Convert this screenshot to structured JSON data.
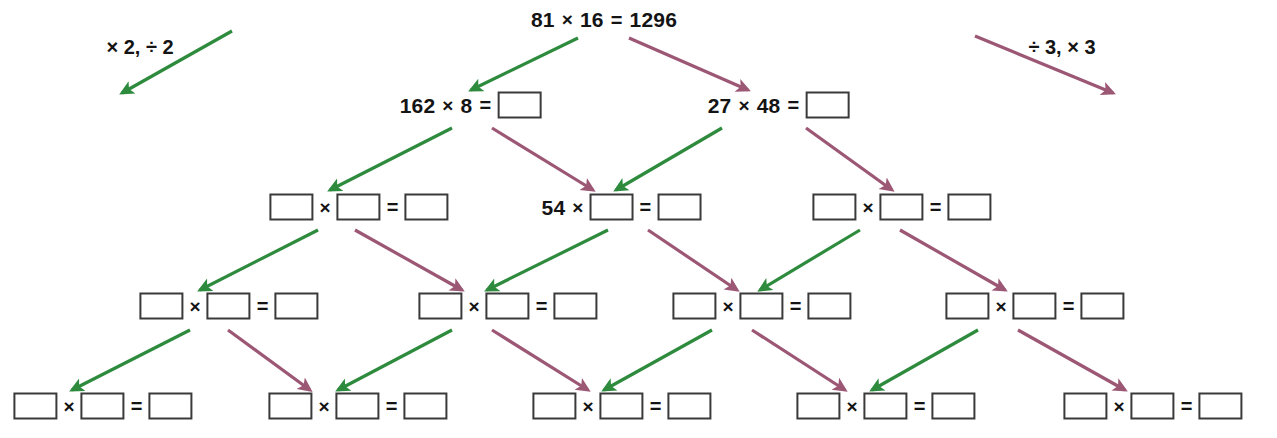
{
  "page": {
    "background": "#ffffff",
    "width": 1277,
    "height": 438
  },
  "colors": {
    "green_arrow": "#2e8b3d",
    "purple_arrow": "#9c5775",
    "text": "#141414",
    "box_border": "#3a3a3a"
  },
  "legend": {
    "left": {
      "label": "× 2, ÷ 2",
      "x": 140,
      "y": 47,
      "arrow_color": "green_arrow",
      "arrow": {
        "x1": 232,
        "y1": 31,
        "x2": 122,
        "y2": 93
      }
    },
    "right": {
      "label": "÷ 3, × 3",
      "x": 1062,
      "y": 47,
      "arrow_color": "purple_arrow",
      "arrow": {
        "x1": 975,
        "y1": 36,
        "x2": 1113,
        "y2": 93
      }
    }
  },
  "symbols": {
    "times": "×",
    "equals": "=",
    "divide": "÷"
  },
  "rows": [
    {
      "index": 0,
      "y": 20,
      "nodes": [
        {
          "id": "n0-0",
          "x": 604,
          "a": {
            "type": "text",
            "value": "81"
          },
          "b": {
            "type": "text",
            "value": "16"
          },
          "c": {
            "type": "text",
            "value": "1296"
          }
        }
      ]
    },
    {
      "index": 1,
      "y": 105,
      "nodes": [
        {
          "id": "n1-0",
          "x": 470,
          "a": {
            "type": "text",
            "value": "162"
          },
          "b": {
            "type": "text",
            "value": "8"
          },
          "c": {
            "type": "blank",
            "value": ""
          }
        },
        {
          "id": "n1-1",
          "x": 778,
          "a": {
            "type": "text",
            "value": "27"
          },
          "b": {
            "type": "text",
            "value": "48"
          },
          "c": {
            "type": "blank",
            "value": ""
          }
        }
      ]
    },
    {
      "index": 2,
      "y": 207,
      "nodes": [
        {
          "id": "n2-0",
          "x": 359,
          "a": {
            "type": "blank",
            "value": ""
          },
          "b": {
            "type": "blank",
            "value": ""
          },
          "c": {
            "type": "blank",
            "value": ""
          }
        },
        {
          "id": "n2-1",
          "x": 621,
          "a": {
            "type": "text",
            "value": "54"
          },
          "b": {
            "type": "blank",
            "value": ""
          },
          "c": {
            "type": "blank",
            "value": ""
          }
        },
        {
          "id": "n2-2",
          "x": 902,
          "a": {
            "type": "blank",
            "value": ""
          },
          "b": {
            "type": "blank",
            "value": ""
          },
          "c": {
            "type": "blank",
            "value": ""
          }
        }
      ]
    },
    {
      "index": 3,
      "y": 306,
      "nodes": [
        {
          "id": "n3-0",
          "x": 229,
          "a": {
            "type": "blank",
            "value": ""
          },
          "b": {
            "type": "blank",
            "value": ""
          },
          "c": {
            "type": "blank",
            "value": ""
          }
        },
        {
          "id": "n3-1",
          "x": 508,
          "a": {
            "type": "blank",
            "value": ""
          },
          "b": {
            "type": "blank",
            "value": ""
          },
          "c": {
            "type": "blank",
            "value": ""
          }
        },
        {
          "id": "n3-2",
          "x": 762,
          "a": {
            "type": "blank",
            "value": ""
          },
          "b": {
            "type": "blank",
            "value": ""
          },
          "c": {
            "type": "blank",
            "value": ""
          }
        },
        {
          "id": "n3-3",
          "x": 1035,
          "a": {
            "type": "blank",
            "value": ""
          },
          "b": {
            "type": "blank",
            "value": ""
          },
          "c": {
            "type": "blank",
            "value": ""
          }
        }
      ]
    },
    {
      "index": 4,
      "y": 406,
      "nodes": [
        {
          "id": "n4-0",
          "x": 103,
          "a": {
            "type": "blank",
            "value": ""
          },
          "b": {
            "type": "blank",
            "value": ""
          },
          "c": {
            "type": "blank",
            "value": ""
          }
        },
        {
          "id": "n4-1",
          "x": 358,
          "a": {
            "type": "blank",
            "value": ""
          },
          "b": {
            "type": "blank",
            "value": ""
          },
          "c": {
            "type": "blank",
            "value": ""
          }
        },
        {
          "id": "n4-2",
          "x": 622,
          "a": {
            "type": "blank",
            "value": ""
          },
          "b": {
            "type": "blank",
            "value": ""
          },
          "c": {
            "type": "blank",
            "value": ""
          }
        },
        {
          "id": "n4-3",
          "x": 886,
          "a": {
            "type": "blank",
            "value": ""
          },
          "b": {
            "type": "blank",
            "value": ""
          },
          "c": {
            "type": "blank",
            "value": ""
          }
        },
        {
          "id": "n4-4",
          "x": 1153,
          "a": {
            "type": "blank",
            "value": ""
          },
          "b": {
            "type": "blank",
            "value": ""
          },
          "c": {
            "type": "blank",
            "value": ""
          }
        }
      ]
    }
  ],
  "arrows": [
    {
      "from": "n0-0",
      "to": "n1-0",
      "kind": "green",
      "x1": 578,
      "y1": 38,
      "x2": 471,
      "y2": 90
    },
    {
      "from": "n0-0",
      "to": "n1-1",
      "kind": "purple",
      "x1": 629,
      "y1": 38,
      "x2": 748,
      "y2": 90
    },
    {
      "from": "n1-0",
      "to": "n2-0",
      "kind": "green",
      "x1": 452,
      "y1": 128,
      "x2": 330,
      "y2": 190
    },
    {
      "from": "n1-0",
      "to": "n2-1",
      "kind": "purple",
      "x1": 492,
      "y1": 128,
      "x2": 593,
      "y2": 190
    },
    {
      "from": "n1-1",
      "to": "n2-1",
      "kind": "green",
      "x1": 722,
      "y1": 128,
      "x2": 616,
      "y2": 190
    },
    {
      "from": "n1-1",
      "to": "n2-2",
      "kind": "purple",
      "x1": 806,
      "y1": 128,
      "x2": 892,
      "y2": 190
    },
    {
      "from": "n2-0",
      "to": "n3-0",
      "kind": "green",
      "x1": 318,
      "y1": 230,
      "x2": 200,
      "y2": 290
    },
    {
      "from": "n2-0",
      "to": "n3-1",
      "kind": "purple",
      "x1": 355,
      "y1": 230,
      "x2": 462,
      "y2": 290
    },
    {
      "from": "n2-1",
      "to": "n3-1",
      "kind": "green",
      "x1": 608,
      "y1": 230,
      "x2": 487,
      "y2": 290
    },
    {
      "from": "n2-1",
      "to": "n3-2",
      "kind": "purple",
      "x1": 648,
      "y1": 230,
      "x2": 737,
      "y2": 290
    },
    {
      "from": "n2-2",
      "to": "n3-2",
      "kind": "green",
      "x1": 860,
      "y1": 230,
      "x2": 760,
      "y2": 290
    },
    {
      "from": "n2-2",
      "to": "n3-3",
      "kind": "purple",
      "x1": 900,
      "y1": 230,
      "x2": 1005,
      "y2": 290
    },
    {
      "from": "n3-0",
      "to": "n4-0",
      "kind": "green",
      "x1": 190,
      "y1": 330,
      "x2": 72,
      "y2": 390
    },
    {
      "from": "n3-0",
      "to": "n4-1",
      "kind": "purple",
      "x1": 228,
      "y1": 330,
      "x2": 310,
      "y2": 390
    },
    {
      "from": "n3-1",
      "to": "n4-1",
      "kind": "green",
      "x1": 452,
      "y1": 330,
      "x2": 338,
      "y2": 390
    },
    {
      "from": "n3-1",
      "to": "n4-2",
      "kind": "purple",
      "x1": 492,
      "y1": 330,
      "x2": 588,
      "y2": 390
    },
    {
      "from": "n3-2",
      "to": "n4-2",
      "kind": "green",
      "x1": 712,
      "y1": 330,
      "x2": 604,
      "y2": 390
    },
    {
      "from": "n3-2",
      "to": "n4-3",
      "kind": "purple",
      "x1": 752,
      "y1": 330,
      "x2": 845,
      "y2": 390
    },
    {
      "from": "n3-3",
      "to": "n4-3",
      "kind": "green",
      "x1": 978,
      "y1": 330,
      "x2": 872,
      "y2": 390
    },
    {
      "from": "n3-3",
      "to": "n4-4",
      "kind": "purple",
      "x1": 1018,
      "y1": 330,
      "x2": 1125,
      "y2": 390
    }
  ]
}
